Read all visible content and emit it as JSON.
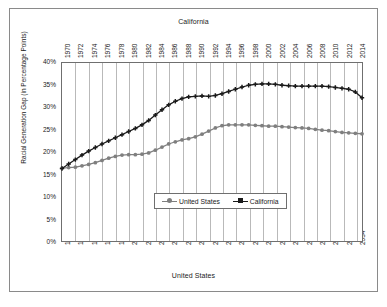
{
  "chart_data": {
    "type": "line",
    "title": "",
    "top_axis_title": "California",
    "bottom_axis_title": "United States",
    "xlabel": "United States",
    "ylabel": "Racial Generation Gap (in Percentage Points)",
    "ylim": [
      0,
      40
    ],
    "yticks": [
      0,
      5,
      10,
      15,
      20,
      25,
      30,
      35,
      40
    ],
    "ytick_labels": [
      "0%",
      "5%",
      "10%",
      "15%",
      "20%",
      "25%",
      "30%",
      "35%",
      "40%"
    ],
    "grid": "vertical",
    "legend_position": "inside-lower-center",
    "x_bottom_ticks": [
      "1990",
      "1992",
      "1994",
      "1996",
      "1998",
      "2000",
      "2002",
      "2004",
      "2006",
      "2008",
      "2010",
      "2012",
      "2014",
      "2016",
      "2018",
      "2020",
      "2022",
      "2024",
      "2026",
      "2028",
      "2030",
      "2032",
      "2034"
    ],
    "x_top_ticks": [
      "1970",
      "1972",
      "1974",
      "1976",
      "1978",
      "1980",
      "1982",
      "1984",
      "1986",
      "1988",
      "1990",
      "1992",
      "1994",
      "1996",
      "1998",
      "2000",
      "2002",
      "2004",
      "2006",
      "2008",
      "2010",
      "2012",
      "2014"
    ],
    "x_bottom_range": [
      1990,
      2035
    ],
    "x_top_range": [
      1970,
      2015
    ],
    "series": [
      {
        "name": "United States",
        "color": "#7f7f7f",
        "marker": "circle",
        "x": [
          1990,
          1991,
          1992,
          1993,
          1994,
          1995,
          1996,
          1997,
          1998,
          1999,
          2000,
          2001,
          2002,
          2003,
          2004,
          2005,
          2006,
          2007,
          2008,
          2009,
          2010,
          2011,
          2012,
          2013,
          2014,
          2015,
          2016,
          2017,
          2018,
          2019,
          2020,
          2021,
          2022,
          2023,
          2024,
          2025,
          2026,
          2027,
          2028,
          2029,
          2030,
          2031,
          2032,
          2033,
          2034,
          2035
        ],
        "values": [
          16.4,
          16.5,
          16.6,
          16.9,
          17.2,
          17.6,
          18.1,
          18.6,
          19.0,
          19.3,
          19.4,
          19.4,
          19.5,
          19.8,
          20.4,
          21.1,
          21.8,
          22.3,
          22.7,
          23.0,
          23.4,
          24.0,
          24.7,
          25.4,
          25.9,
          26.1,
          26.1,
          26.1,
          26.1,
          26.0,
          25.9,
          25.8,
          25.8,
          25.7,
          25.6,
          25.5,
          25.4,
          25.3,
          25.1,
          24.9,
          24.8,
          24.6,
          24.4,
          24.3,
          24.2,
          24.1
        ]
      },
      {
        "name": "California",
        "color": "#1a1a1a",
        "marker": "plus",
        "x": [
          1970,
          1971,
          1972,
          1973,
          1974,
          1975,
          1976,
          1977,
          1978,
          1979,
          1980,
          1981,
          1982,
          1983,
          1984,
          1985,
          1986,
          1987,
          1988,
          1989,
          1990,
          1991,
          1992,
          1993,
          1994,
          1995,
          1996,
          1997,
          1998,
          1999,
          2000,
          2001,
          2002,
          2003,
          2004,
          2005,
          2006,
          2007,
          2008,
          2009,
          2010,
          2011,
          2012,
          2013,
          2014,
          2015
        ],
        "values": [
          16.3,
          17.3,
          18.3,
          19.3,
          20.2,
          21.0,
          21.8,
          22.5,
          23.2,
          23.9,
          24.6,
          25.3,
          26.1,
          27.1,
          28.3,
          29.5,
          30.6,
          31.4,
          32.0,
          32.4,
          32.5,
          32.6,
          32.5,
          32.7,
          33.1,
          33.6,
          34.1,
          34.6,
          35.0,
          35.2,
          35.3,
          35.3,
          35.2,
          35.0,
          34.9,
          34.8,
          34.8,
          34.8,
          34.8,
          34.8,
          34.7,
          34.5,
          34.3,
          34.1,
          33.5,
          32.2
        ]
      }
    ]
  },
  "legend": {
    "items": [
      {
        "label": "United States"
      },
      {
        "label": "California"
      }
    ]
  }
}
